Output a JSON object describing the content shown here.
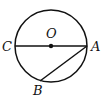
{
  "diagram": {
    "type": "geometry",
    "circle": {
      "center": "O",
      "cx": 51,
      "cy": 46,
      "r": 36
    },
    "points": [
      {
        "name": "C",
        "x": 15,
        "y": 46,
        "label": "C"
      },
      {
        "name": "O",
        "x": 51,
        "y": 46,
        "label": "O"
      },
      {
        "name": "A",
        "x": 87,
        "y": 46,
        "label": "A"
      },
      {
        "name": "B",
        "x": 40,
        "y": 81,
        "label": "B"
      }
    ],
    "segments": [
      {
        "from": "C",
        "to": "A",
        "kind": "diameter"
      },
      {
        "from": "A",
        "to": "B",
        "kind": "chord"
      }
    ],
    "colors": {
      "stroke": "#111111",
      "background": "#ffffff"
    }
  }
}
